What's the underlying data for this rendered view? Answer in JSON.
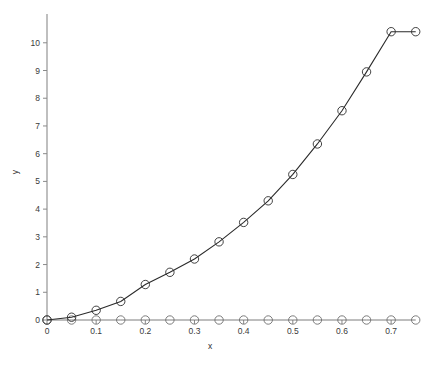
{
  "chart_data": {
    "type": "line",
    "title": "",
    "subtitle": "",
    "xlabel": "x",
    "ylabel": "y",
    "xlim": [
      0,
      0.775
    ],
    "ylim": [
      0,
      10.75
    ],
    "grid": false,
    "legend": "none",
    "marker": "circle-open",
    "x": [
      0,
      0.05,
      0.1,
      0.15,
      0.2,
      0.25,
      0.3,
      0.35,
      0.4,
      0.45,
      0.5,
      0.55,
      0.6,
      0.65,
      0.7,
      0.75
    ],
    "series": [
      {
        "name": "growth-curve",
        "color": "#2b2b2b",
        "values": [
          0.0,
          0.1,
          0.35,
          0.67,
          1.28,
          1.72,
          2.2,
          2.82,
          3.52,
          4.3,
          5.25,
          6.35,
          7.55,
          8.95,
          10.4,
          10.4
        ]
      },
      {
        "name": "baseline",
        "color": "#6e6e6e",
        "values": [
          0,
          0,
          0,
          0,
          0,
          0,
          0,
          0,
          0,
          0,
          0,
          0,
          0,
          0,
          0,
          0
        ]
      }
    ],
    "xticks": [
      {
        "value": 0,
        "label": "0"
      },
      {
        "value": 0.1,
        "label": "0.1"
      },
      {
        "value": 0.2,
        "label": "0.2"
      },
      {
        "value": 0.3,
        "label": "0.3"
      },
      {
        "value": 0.4,
        "label": "0.4"
      },
      {
        "value": 0.5,
        "label": "0.5"
      },
      {
        "value": 0.6,
        "label": "0.6"
      },
      {
        "value": 0.7,
        "label": "0.7"
      }
    ],
    "yticks": [
      {
        "value": 0,
        "label": "0"
      },
      {
        "value": 1,
        "label": "1"
      },
      {
        "value": 2,
        "label": "2"
      },
      {
        "value": 3,
        "label": "3"
      },
      {
        "value": 4,
        "label": "4"
      },
      {
        "value": 5,
        "label": "5"
      },
      {
        "value": 6,
        "label": "6"
      },
      {
        "value": 7,
        "label": "7"
      },
      {
        "value": 8,
        "label": "8"
      },
      {
        "value": 9,
        "label": "9"
      },
      {
        "value": 10,
        "label": "10"
      }
    ],
    "colors": {
      "background": "#ffffff",
      "axis": "#8a8a8a",
      "curve": "#2b2b2b",
      "baseline": "#6e6e6e",
      "text": "#3a3a3a"
    }
  }
}
